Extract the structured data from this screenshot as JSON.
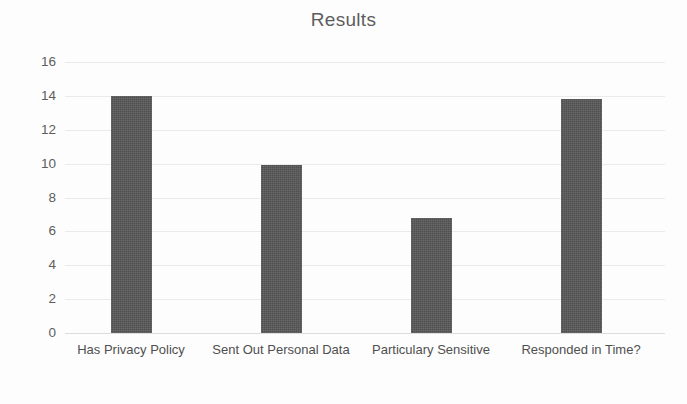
{
  "chart_data": {
    "type": "bar",
    "title": "Results",
    "categories": [
      "Has Privacy Policy",
      "Sent Out Personal Data",
      "Particulary Sensitive",
      "Responded in Time?"
    ],
    "values": [
      14,
      9.9,
      6.8,
      13.8
    ],
    "xlabel": "",
    "ylabel": "",
    "ylim": [
      0,
      16
    ],
    "yticks": [
      0,
      2,
      4,
      6,
      8,
      10,
      12,
      14,
      16
    ],
    "ytick_labels": [
      "0",
      "2",
      "4",
      "6",
      "8",
      "10",
      "12",
      "14",
      "16"
    ],
    "grid": true,
    "legend": false,
    "series": [
      {
        "name": "Results",
        "values": [
          14,
          9.9,
          6.8,
          13.8
        ],
        "color": "#585858"
      }
    ]
  },
  "style": {
    "bar_color": "#585858",
    "grid_color": "#eaeaea",
    "axis_color": "#dcdcdc",
    "title_color": "#5d5d5d",
    "tick_color": "#5e5e5e",
    "label_color": "#4f4f4f",
    "background": "#fdfdfd"
  }
}
